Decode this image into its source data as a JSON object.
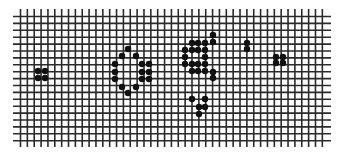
{
  "grid": {
    "cols": 45,
    "rows": 19,
    "x0": 20.5,
    "y0": 16.5,
    "dx": 6.86,
    "dy": 6.9,
    "h_line_left": 13,
    "h_line_right": 331,
    "v_line_top": 9,
    "v_line_bottom": 147,
    "line_color": "#2a2a2a",
    "line_width": 1.6,
    "background": "#ffffff"
  },
  "cells": {
    "color": "#111111",
    "radius": 3.2,
    "patterns": [
      {
        "name": "block-left",
        "points": [
          [
            38,
            71
          ],
          [
            45,
            71
          ],
          [
            38,
            78
          ],
          [
            45,
            78
          ]
        ]
      },
      {
        "name": "ring-middle",
        "points": [
          [
            128,
            49
          ],
          [
            122,
            56
          ],
          [
            136,
            56
          ],
          [
            115,
            64
          ],
          [
            142,
            64
          ],
          [
            149,
            64
          ],
          [
            115,
            72
          ],
          [
            142,
            72
          ],
          [
            149,
            72
          ],
          [
            115,
            79
          ],
          [
            142,
            79
          ],
          [
            149,
            79
          ],
          [
            122,
            87
          ],
          [
            136,
            87
          ],
          [
            128,
            93
          ]
        ]
      },
      {
        "name": "cluster-right-center",
        "points": [
          [
            213,
            35
          ],
          [
            213,
            42
          ],
          [
            192,
            43
          ],
          [
            198,
            43
          ],
          [
            205,
            43
          ],
          [
            185,
            50
          ],
          [
            192,
            50
          ],
          [
            198,
            50
          ],
          [
            205,
            50
          ],
          [
            185,
            57
          ],
          [
            205,
            57
          ],
          [
            185,
            64
          ],
          [
            192,
            64
          ],
          [
            198,
            64
          ],
          [
            205,
            64
          ],
          [
            192,
            71
          ],
          [
            198,
            71
          ],
          [
            205,
            71
          ],
          [
            213,
            72
          ],
          [
            213,
            78
          ]
        ]
      },
      {
        "name": "blinker-right",
        "points": [
          [
            247,
            43
          ],
          [
            247,
            49
          ]
        ]
      },
      {
        "name": "block-right",
        "points": [
          [
            276,
            57
          ],
          [
            283,
            57
          ],
          [
            276,
            63
          ],
          [
            283,
            63
          ]
        ]
      },
      {
        "name": "glider-bottom",
        "points": [
          [
            192,
            99
          ],
          [
            205,
            99
          ],
          [
            199,
            107
          ],
          [
            205,
            107
          ],
          [
            199,
            114
          ]
        ]
      }
    ]
  }
}
